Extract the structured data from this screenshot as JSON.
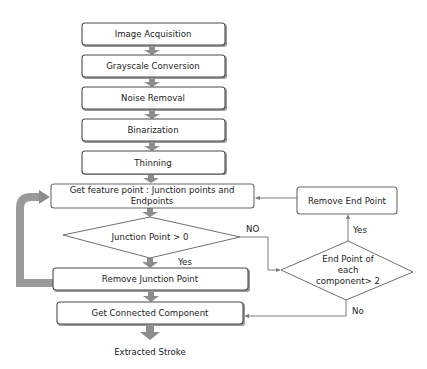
{
  "diagram": {
    "type": "flowchart",
    "nodes": {
      "image_acquisition": "Image Acquisition",
      "grayscale_conversion": "Grayscale Conversion",
      "noise_removal": "Noise Removal",
      "binarization": "Binarization",
      "thinning": "Thinning",
      "get_feature_point_line1": "Get feature point : Junction points and",
      "get_feature_point_line2": "Endpoints",
      "junction_decision": "Junction Point > 0",
      "remove_junction_point": "Remove Junction Point",
      "get_connected_component": "Get Connected Component",
      "extracted_stroke": "Extracted Stroke",
      "remove_end_point": "Remove End Point",
      "endpoint_decision_line1": "End Point  of",
      "endpoint_decision_line2": "each",
      "endpoint_decision_line3": "component> 2"
    },
    "edge_labels": {
      "junction_no": "NO",
      "junction_yes": "Yes",
      "endpoint_yes": "Yes",
      "endpoint_no": "No"
    },
    "edges": [
      {
        "from": "Image Acquisition",
        "to": "Grayscale Conversion"
      },
      {
        "from": "Grayscale Conversion",
        "to": "Noise Removal"
      },
      {
        "from": "Noise Removal",
        "to": "Binarization"
      },
      {
        "from": "Binarization",
        "to": "Thinning"
      },
      {
        "from": "Thinning",
        "to": "Get feature point : Junction points and Endpoints"
      },
      {
        "from": "Get feature point : Junction points and Endpoints",
        "to": "Junction Point > 0"
      },
      {
        "from": "Junction Point > 0",
        "to": "Remove Junction Point",
        "label": "Yes"
      },
      {
        "from": "Junction Point > 0",
        "to": "End Point of each component> 2",
        "label": "NO"
      },
      {
        "from": "Remove Junction Point",
        "to": "Get feature point : Junction points and Endpoints"
      },
      {
        "from": "Remove Junction Point",
        "to": "Get Connected Component"
      },
      {
        "from": "End Point of each component> 2",
        "to": "Remove End Point",
        "label": "Yes"
      },
      {
        "from": "End Point of each component> 2",
        "to": "Get Connected Component",
        "label": "No"
      },
      {
        "from": "Remove End Point",
        "to": "Get feature point : Junction points and Endpoints"
      },
      {
        "from": "Get Connected Component",
        "to": "Extracted Stroke"
      }
    ],
    "colors": {
      "box_border": "#4a4a4a",
      "arrow_fill": "#8c8c8c",
      "loop_arrow": "#9a9a9a",
      "connector_line": "#7a7a7a",
      "text": "#222222"
    }
  }
}
